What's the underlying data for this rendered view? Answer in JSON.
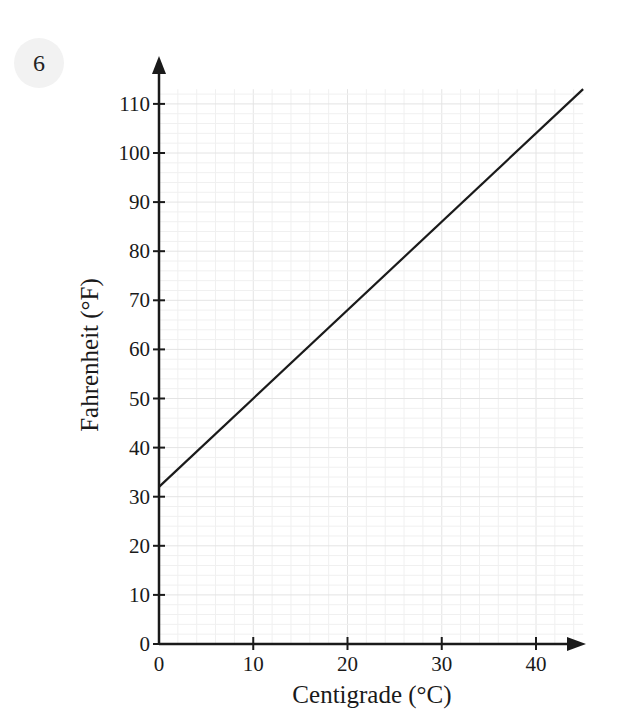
{
  "question_number": "6",
  "chart_data": {
    "type": "line",
    "title": "",
    "xlabel": "Centigrade (°C)",
    "ylabel": "Fahrenheit (°F)",
    "xlim": [
      0,
      45
    ],
    "ylim": [
      0,
      113
    ],
    "x_ticks": [
      0,
      10,
      20,
      30,
      40
    ],
    "y_ticks": [
      0,
      10,
      20,
      30,
      40,
      50,
      60,
      70,
      80,
      90,
      100,
      110
    ],
    "grid": true,
    "grid_minor_step": 2,
    "legend": null,
    "series": [
      {
        "name": "Fahrenheit vs Centigrade",
        "x": [
          0,
          45
        ],
        "y": [
          32,
          113
        ]
      }
    ],
    "colors": {
      "line": "#1a1a1a",
      "axis": "#1a1a1a",
      "grid_minor": "#f0f0f0",
      "grid_major": "#e4e4e4"
    }
  }
}
